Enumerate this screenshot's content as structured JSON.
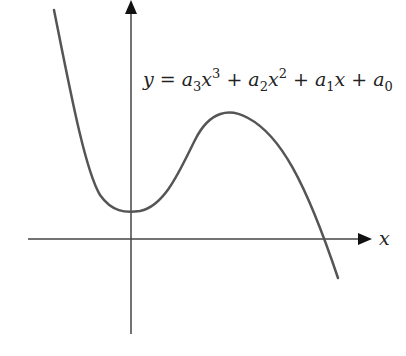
{
  "diagram": {
    "equation": {
      "y": "y",
      "eq": " = ",
      "a3": "a",
      "s3": "3",
      "x3": "x",
      "p3": "3",
      "plus1": " + ",
      "a2": "a",
      "s2": "2",
      "x2": "x",
      "p2": "2",
      "plus2": " + ",
      "a1": "a",
      "s1": "1",
      "x1": "x",
      "plus3": " + ",
      "a0": "a",
      "s0": "0"
    },
    "x_axis_label": "x",
    "colors": {
      "curve": "#555555",
      "axes": "#444444",
      "text": "#222222"
    }
  }
}
